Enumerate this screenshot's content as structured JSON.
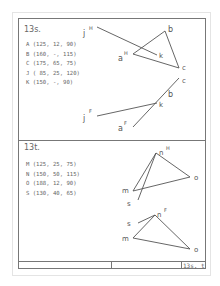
{
  "sheet": {
    "footer_label": "13s, t"
  },
  "problem_13s": {
    "title": "13s.",
    "points": [
      "A (125, 12,  90)",
      "B (160,  -, 115)",
      "C (175, 65,  75)",
      "J ( 85, 25, 120)",
      "K (150,  -,  90)"
    ],
    "top_view_labels": {
      "j": "j",
      "j_sup": "H",
      "a": "a",
      "a_sup": "H",
      "b": "b",
      "c": "c",
      "k": "k"
    },
    "front_view_labels": {
      "j": "j",
      "j_sup": "F",
      "a": "a",
      "a_sup": "F",
      "b": "b",
      "c": "c",
      "k": "k"
    }
  },
  "problem_13t": {
    "title": "13t.",
    "points": [
      "M (125, 25,  75)",
      "N (150, 50, 115)",
      "O (188, 12,  90)",
      "S (130, 40,  65)"
    ],
    "top_view_labels": {
      "n": "n",
      "n_sup": "H",
      "m": "m",
      "o": "o",
      "s": "s"
    },
    "front_view_labels": {
      "n": "n",
      "n_sup": "F",
      "m": "m",
      "o": "o",
      "s": "s"
    }
  }
}
